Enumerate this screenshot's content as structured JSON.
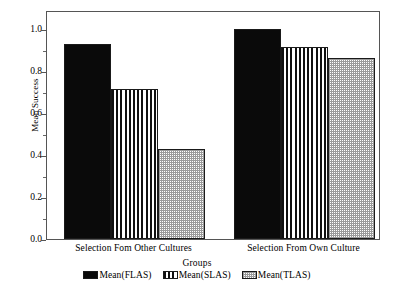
{
  "chart_data": {
    "type": "bar",
    "title": "",
    "xlabel": "Groups",
    "ylabel": "Mean Success",
    "ylim": [
      0.0,
      1.0
    ],
    "grid": false,
    "legend_position": "bottom",
    "categories": [
      "Selection Fom Other Cultures",
      "Selection From Own Culture"
    ],
    "series": [
      {
        "name": "Mean(FLAS)",
        "fill": "solid",
        "values": [
          0.93,
          1.0
        ]
      },
      {
        "name": "Mean(SLAS)",
        "fill": "vstripe",
        "values": [
          0.715,
          0.915
        ]
      },
      {
        "name": "Mean(TLAS)",
        "fill": "checker",
        "values": [
          0.43,
          0.86
        ]
      }
    ],
    "y_ticks": [
      "0.0",
      "0.2",
      "0.4",
      "0.6",
      "0.8",
      "1.0"
    ],
    "y_tick_values": [
      0.0,
      0.2,
      0.4,
      0.6,
      0.8,
      1.0
    ],
    "y_minor_tick_values": [
      0.1,
      0.3,
      0.5,
      0.7,
      0.9
    ]
  },
  "axis": {
    "y_title": "Mean Success",
    "x_title": "Groups"
  },
  "colors": {
    "bar_solid": "#0a0a0a",
    "bar_stripe": "#111111",
    "bar_checker": "#9a9a9a",
    "frame": "#555555",
    "background": "#ffffff"
  }
}
